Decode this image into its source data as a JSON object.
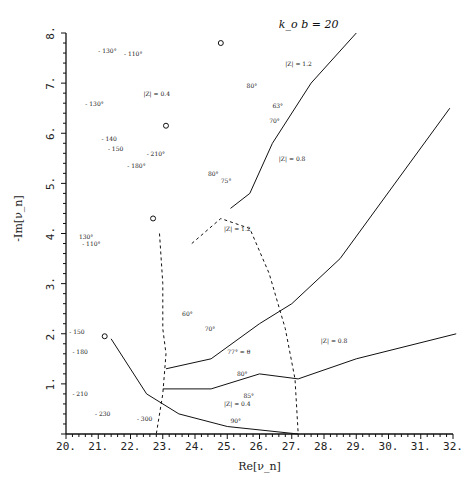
{
  "chart_data": {
    "type": "line",
    "trace_note": "Axis ticks, axis labels, annotations, pole positions and triangle markers were read from the image. Every coordinate in 'series' is a hand-traced approximation of the curves, placed to reproduce the figure's shape. None of it is measured data.",
    "title": "",
    "parameter_label": "k_o b = 20",
    "xlabel": "Re[ν_n]",
    "ylabel": "-Im[ν_n]",
    "xlim": [
      20,
      32
    ],
    "ylim": [
      0,
      8
    ],
    "grid": false,
    "x_ticks": [
      "20.",
      "21.",
      "22.",
      "23.",
      "24.",
      "25.",
      "26.",
      "27.",
      "28.",
      "29.",
      "30.",
      "31.",
      "32."
    ],
    "y_ticks": [
      "0.",
      "1.",
      "2.",
      "3.",
      "4.",
      "5.",
      "6.",
      "7.",
      "8."
    ],
    "poles": [
      {
        "label": "ν1",
        "x": 21.2,
        "y": 1.95
      },
      {
        "label": "ν2",
        "x": 22.7,
        "y": 4.3
      },
      {
        "label": "ν3",
        "x": 23.1,
        "y": 6.15
      },
      {
        "label": "ν4",
        "x": 24.8,
        "y": 7.8
      }
    ],
    "annotations": [
      {
        "text": "k_o b = 20",
        "x": 26.6,
        "y": 8.1
      },
      {
        "text": "|Z| = 1.2",
        "x": 26.8,
        "y": 7.35
      },
      {
        "text": "|Z| = 0.4",
        "x": 22.4,
        "y": 6.75
      },
      {
        "text": "|Z| = 0.8",
        "x": 26.6,
        "y": 5.45
      },
      {
        "text": "|Z| = 1.2",
        "x": 24.9,
        "y": 4.05
      },
      {
        "text": "|Z| = 0.8",
        "x": 27.9,
        "y": 1.82
      },
      {
        "text": "|Z| = 0.4",
        "x": 24.9,
        "y": 0.55
      },
      {
        "text": "77° = θ",
        "x": 25.0,
        "y": 1.6
      },
      {
        "text": "90°",
        "x": 25.1,
        "y": 0.22
      },
      {
        "text": "- 130°",
        "x": 21.0,
        "y": 7.6
      },
      {
        "text": "- 110°",
        "x": 21.8,
        "y": 7.55
      },
      {
        "text": "- 130°",
        "x": 20.6,
        "y": 6.55
      },
      {
        "text": "- 140",
        "x": 21.1,
        "y": 5.85
      },
      {
        "text": "- 150",
        "x": 21.3,
        "y": 5.65
      },
      {
        "text": "- 210°",
        "x": 22.5,
        "y": 5.55
      },
      {
        "text": "- 180°",
        "x": 21.9,
        "y": 5.3
      },
      {
        "text": "130°",
        "x": 20.4,
        "y": 3.9
      },
      {
        "text": "- 110°",
        "x": 20.5,
        "y": 3.75
      },
      {
        "text": "- 150",
        "x": 20.1,
        "y": 2.0
      },
      {
        "text": "- 180",
        "x": 20.2,
        "y": 1.6
      },
      {
        "text": "- 210",
        "x": 20.2,
        "y": 0.75
      },
      {
        "text": "- 230",
        "x": 20.9,
        "y": 0.35
      },
      {
        "text": "- 300",
        "x": 22.2,
        "y": 0.25
      },
      {
        "text": "60°",
        "x": 23.6,
        "y": 2.35
      },
      {
        "text": "70°",
        "x": 24.3,
        "y": 2.05
      },
      {
        "text": "80°",
        "x": 25.3,
        "y": 1.15
      },
      {
        "text": "85°",
        "x": 25.5,
        "y": 0.72
      },
      {
        "text": "70°",
        "x": 26.3,
        "y": 6.2
      },
      {
        "text": "63°",
        "x": 26.4,
        "y": 6.5
      },
      {
        "text": "80°",
        "x": 25.6,
        "y": 6.9
      },
      {
        "text": "75°",
        "x": 24.8,
        "y": 5.0
      },
      {
        "text": "80°",
        "x": 24.4,
        "y": 5.15
      }
    ],
    "series": [
      {
        "name": "|Z| = 0.8 dashed",
        "style": "dashed",
        "points": [
          [
            23.9,
            3.8
          ],
          [
            24.8,
            4.3
          ],
          [
            25.7,
            4.1
          ],
          [
            26.3,
            3.2
          ],
          [
            26.8,
            2.1
          ],
          [
            27.1,
            1.1
          ],
          [
            27.2,
            0.0
          ]
        ]
      },
      {
        "name": "|Z| = 0.4 dashed low",
        "style": "dashed",
        "points": [
          [
            22.9,
            4.0
          ],
          [
            23.0,
            3.0
          ],
          [
            23.0,
            2.1
          ],
          [
            23.1,
            1.6
          ],
          [
            23.0,
            0.8
          ],
          [
            22.8,
            0.0
          ]
        ]
      },
      {
        "name": "branch 70°",
        "style": "solid",
        "points": [
          [
            25.1,
            4.5
          ],
          [
            25.7,
            4.8
          ],
          [
            26.4,
            5.8
          ],
          [
            27.6,
            7.0
          ],
          [
            29.0,
            8.0
          ]
        ]
      },
      {
        "name": "branch 80°",
        "style": "solid",
        "points": [
          [
            23.1,
            1.3
          ],
          [
            24.5,
            1.5
          ],
          [
            26.0,
            2.2
          ],
          [
            27.0,
            2.6
          ],
          [
            28.5,
            3.5
          ],
          [
            31.9,
            6.5
          ]
        ]
      },
      {
        "name": "branch 85°",
        "style": "solid",
        "points": [
          [
            23.0,
            0.9
          ],
          [
            24.5,
            0.9
          ],
          [
            26.0,
            1.2
          ],
          [
            27.2,
            1.1
          ],
          [
            29.0,
            1.5
          ],
          [
            32.1,
            2.0
          ]
        ]
      },
      {
        "name": "branch 90°",
        "style": "solid",
        "points": [
          [
            21.4,
            1.9
          ],
          [
            22.5,
            0.8
          ],
          [
            23.5,
            0.4
          ],
          [
            25.0,
            0.15
          ],
          [
            27.2,
            0.0
          ]
        ]
      }
    ]
  }
}
